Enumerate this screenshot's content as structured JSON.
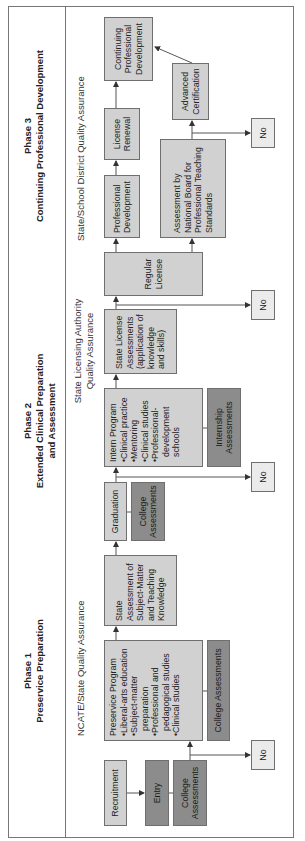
{
  "phases": [
    {
      "number": "Phase 1",
      "title": "Preservice Preparation"
    },
    {
      "number": "Phase 2",
      "title_line1": "Extended Clinical Preparation",
      "title_line2": "and Assessment"
    },
    {
      "number": "Phase 3",
      "title": "Continuing Professional Development"
    }
  ],
  "quality_assurance": {
    "ncate": "NCATE/State Quality Assurance",
    "state_licensing_line1": "State Licensing Authority",
    "state_licensing_line2": "Quality Assurance",
    "district": "State/School District Quality Assurance"
  },
  "boxes": {
    "recruitment": "Recruitment",
    "entry": "Entry",
    "college_assessments_1": "College Assessments",
    "preservice_program": {
      "title": "Preservice Program",
      "items": [
        "Liberal-arts education",
        "Subject-matter preparation",
        "Professional and pedagogical studies",
        "Clinical studies"
      ]
    },
    "college_assessments_2": "College Assessments",
    "state_assessment": "State Assessment of Subject-Matter and Teaching Knowledge",
    "graduation": "Graduation",
    "college_assessments_3": "College Assessments",
    "intern_program": {
      "title": "Intern Program",
      "items": [
        "Clinical practice",
        "Mentoring",
        "Clinical studies",
        "Professional-development schools"
      ]
    },
    "internship_assessments": "Internship Assessments",
    "state_license_assessments": "State License Assessments (application of knowledge and skills)",
    "regular_license": "Regular License",
    "professional_development": "Professional Development",
    "license_renewal": "License Renewal",
    "continuing_pd": "Continuing Professional Development",
    "nbpts": "Assessment by National Board for Professional Teaching Standards",
    "advanced_certification": "Advanced Certification",
    "no_label": "No"
  },
  "colors": {
    "light_box": "#d1d1d1",
    "dark_box": "#8c8c8c",
    "no_box": "#ebebeb",
    "border": "#6f6f6f"
  }
}
